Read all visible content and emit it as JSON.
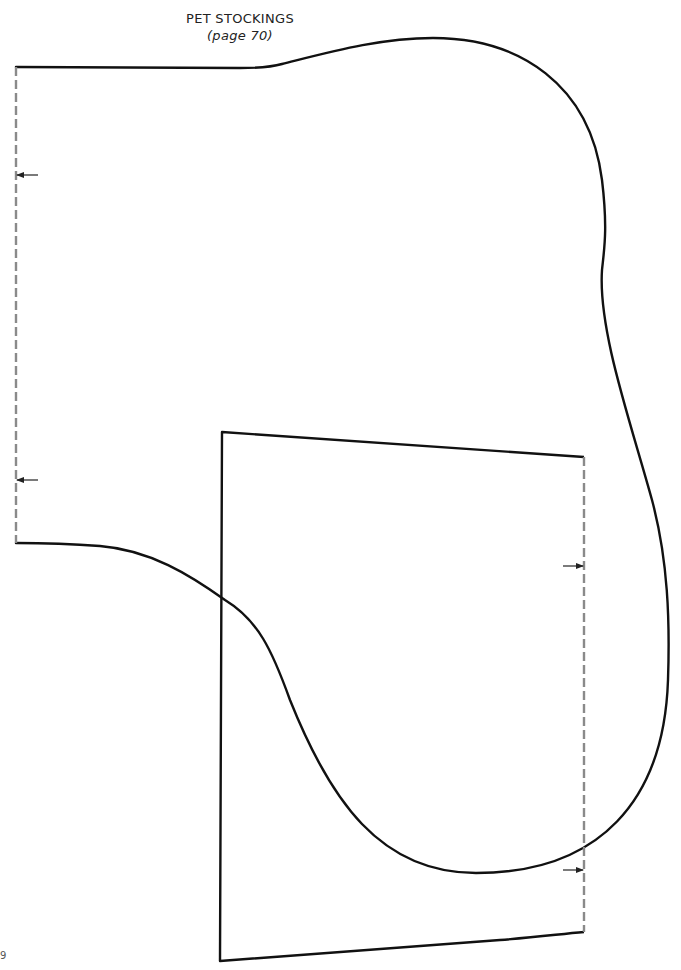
{
  "header": {
    "title": "PET STOCKINGS",
    "subtitle": "(page 70)"
  },
  "pieces": [
    {
      "name": "stocking-leg",
      "outline": "solid",
      "fold_edge": "left-dashed"
    },
    {
      "name": "cuff-rectangle",
      "outline": "solid",
      "fold_edge": "right-dashed"
    }
  ],
  "markers": {
    "fold_arrows": [
      {
        "direction": "left",
        "x": 16,
        "y": 175
      },
      {
        "direction": "left",
        "x": 16,
        "y": 480
      },
      {
        "direction": "right",
        "x": 584,
        "y": 566
      },
      {
        "direction": "right",
        "x": 584,
        "y": 870
      }
    ]
  },
  "footer": {
    "corner_mark": "9"
  },
  "colors": {
    "outline": "#111111",
    "fold_line": "#8a8a8a",
    "text": "#222222"
  }
}
